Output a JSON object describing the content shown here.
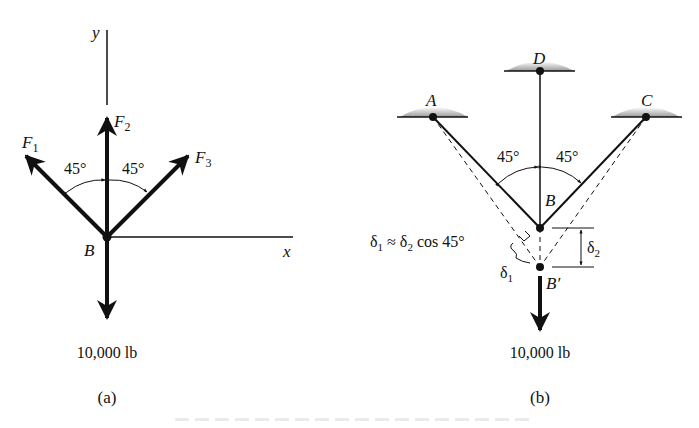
{
  "figure": {
    "panel_a": {
      "label": "(a)",
      "axis_x": "x",
      "axis_y": "y",
      "point": "B",
      "forces": [
        {
          "name": "F",
          "sub": "1"
        },
        {
          "name": "F",
          "sub": "2"
        },
        {
          "name": "F",
          "sub": "3"
        }
      ],
      "angle_left": "45°",
      "angle_right": "45°",
      "load": "10,000 lb"
    },
    "panel_b": {
      "label": "(b)",
      "supports": [
        "A",
        "D",
        "C"
      ],
      "point": "B",
      "displaced_point": "B′",
      "angle_left": "45°",
      "angle_right": "45°",
      "relation": {
        "d1": "δ",
        "d1_sub": "1",
        "approx": " ≈ ",
        "d2": "δ",
        "d2_sub": "2",
        "rest": " cos 45°"
      },
      "delta1": {
        "sym": "δ",
        "sub": "1"
      },
      "delta2": {
        "sym": "δ",
        "sub": "2"
      },
      "load": "10,000 lb"
    }
  }
}
